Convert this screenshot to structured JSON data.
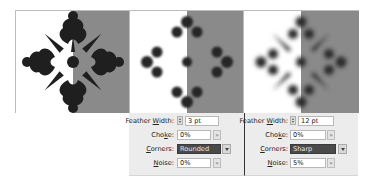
{
  "colors": {
    "grey_half": "#8a8a8a",
    "art_fill": "#1f1f1f",
    "panel_bg": "#ececec",
    "selected_field": "#4a4a4a"
  },
  "panels": [
    {
      "feather_width": {
        "label_pre": "Feather ",
        "label_u": "W",
        "label_post": "idth:",
        "value": "3 pt"
      },
      "choke": {
        "label_pre": "Cho",
        "label_u": "k",
        "label_post": "e:",
        "value": "0%"
      },
      "corners": {
        "label_pre": "",
        "label_u": "C",
        "label_post": "orners:",
        "value": "Rounded"
      },
      "noise": {
        "label_pre": "",
        "label_u": "N",
        "label_post": "oise:",
        "value": "0%"
      }
    },
    {
      "feather_width": {
        "label_pre": "Feather ",
        "label_u": "W",
        "label_post": "idth:",
        "value": "12 pt"
      },
      "choke": {
        "label_pre": "Cho",
        "label_u": "k",
        "label_post": "e:",
        "value": "0%"
      },
      "corners": {
        "label_pre": "",
        "label_u": "C",
        "label_post": "orners:",
        "value": "Sharp"
      },
      "noise": {
        "label_pre": "",
        "label_u": "N",
        "label_post": "oise:",
        "value": "5%"
      }
    }
  ],
  "icons": {
    "slider_arrow": "»",
    "stepper": "up-down-stepper",
    "dropdown": "chevron-down"
  }
}
